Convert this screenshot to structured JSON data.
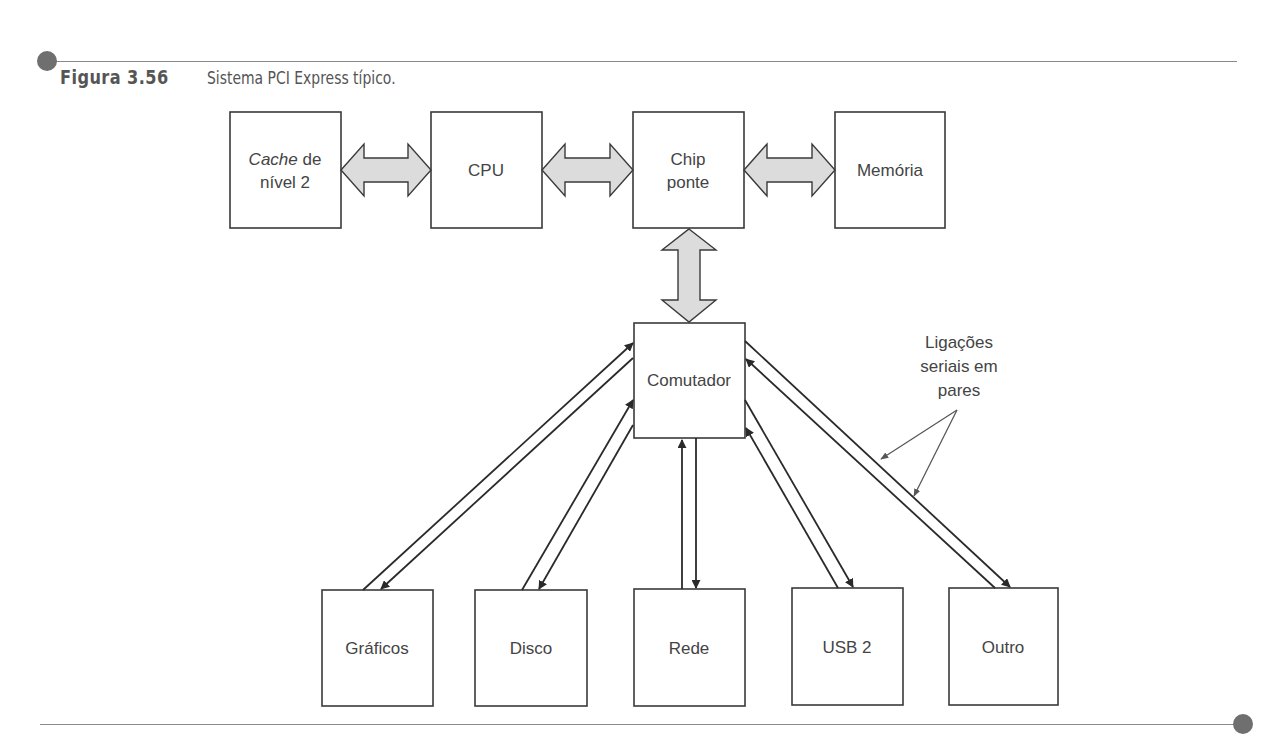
{
  "figure": {
    "number": "Figura 3.56",
    "title": "Sistema PCI Express típico."
  },
  "boxes": {
    "cache": {
      "label_italic": "Cache",
      "label_rest": " de",
      "label_line2": "nível 2"
    },
    "cpu": {
      "label": "CPU"
    },
    "bridge": {
      "line1": "Chip",
      "line2": "ponte"
    },
    "memory": {
      "label": "Memória"
    },
    "switch": {
      "label": "Comutador"
    },
    "devices": [
      {
        "label": "Gráficos"
      },
      {
        "label": "Disco"
      },
      {
        "label": "Rede"
      },
      {
        "label": "USB 2"
      },
      {
        "label": "Outro"
      }
    ]
  },
  "annotation": {
    "line1": "Ligações",
    "line2": "seriais em",
    "line3": "pares"
  },
  "colors": {
    "arrow_fill": "#dcdcdc",
    "stroke": "#3a3a3a",
    "rule": "#8a8a8a",
    "dot": "#6f6f6f"
  }
}
